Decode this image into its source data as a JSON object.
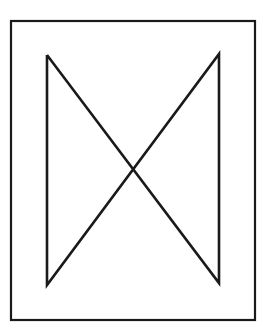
{
  "figure": {
    "background": "#ffffff",
    "stroke_color": "#1a1a1a",
    "frame": {
      "x1": 11,
      "y1": 21,
      "x2": 255,
      "y2": 320,
      "stroke_width": 2.2
    },
    "bowtie": {
      "points": [
        [
          47,
          55
        ],
        [
          47,
          285
        ],
        [
          219,
          54
        ],
        [
          219,
          283
        ],
        [
          47,
          55
        ]
      ],
      "stroke_width": 2.6
    },
    "crossing_point": [
      133,
      170
    ]
  }
}
